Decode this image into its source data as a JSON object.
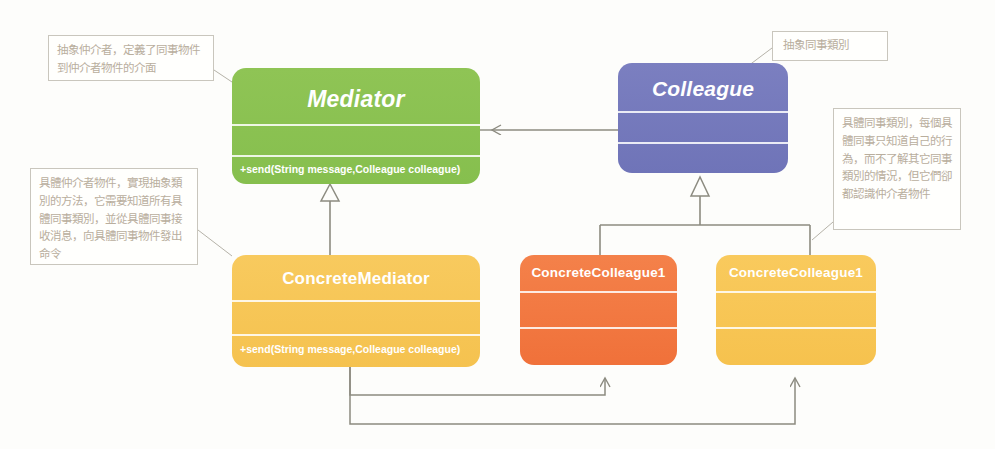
{
  "diagram": {
    "colors": {
      "mediator": "#8cc155",
      "colleague": "#7479bc",
      "concrete_mediator": "#f7c650",
      "concrete_colleague1": "#f2773f",
      "concrete_colleague2": "#f8c64f",
      "connector": "#8c8b80",
      "note_border": "#c9c6bd",
      "note_text": "#b9ae9d"
    },
    "classes": [
      {
        "id": "mediator",
        "name": "Mediator",
        "abstract": true,
        "methods": [
          "+send(String message,Colleague colleague)"
        ]
      },
      {
        "id": "colleague",
        "name": "Colleague",
        "abstract": true,
        "methods": []
      },
      {
        "id": "concrete_mediator",
        "name": "ConcreteMediator",
        "abstract": false,
        "methods": [
          "+send(String message,Colleague colleague)"
        ]
      },
      {
        "id": "concrete_colleague1",
        "name": "ConcreteColleague1",
        "abstract": false,
        "methods": []
      },
      {
        "id": "concrete_colleague2",
        "name": "ConcreteColleague1",
        "abstract": false,
        "methods": []
      }
    ],
    "notes": [
      {
        "id": "note_mediator",
        "text": "抽象仲介者，定義了同事物件到仲介者物件的介面",
        "target": "mediator"
      },
      {
        "id": "note_concrete_mediator",
        "text": "具體仲介者物件，實現抽象類別的方法，它需要知道所有具體同事類別，並從具體同事接收消息，向具體同事物件發出命令",
        "target": "concrete_mediator"
      },
      {
        "id": "note_colleague",
        "text": "抽象同事類別",
        "target": "colleague"
      },
      {
        "id": "note_concrete_colleague",
        "text": "具體同事類別，每個具體同事只知道自己的行為，而不了解其它同事類別的情況，但它們卻都認識仲介者物件",
        "target": "concrete_colleague2"
      }
    ],
    "relations": [
      {
        "from": "colleague",
        "to": "mediator",
        "type": "association",
        "arrow": "open"
      },
      {
        "from": "concrete_mediator",
        "to": "mediator",
        "type": "generalization",
        "arrow": "hollow-triangle"
      },
      {
        "from": "concrete_colleague1",
        "to": "colleague",
        "type": "generalization",
        "arrow": "hollow-triangle"
      },
      {
        "from": "concrete_colleague2",
        "to": "colleague",
        "type": "generalization",
        "arrow": "hollow-triangle"
      },
      {
        "from": "concrete_mediator",
        "to": "concrete_colleague1",
        "type": "association",
        "arrow": "open"
      },
      {
        "from": "concrete_mediator",
        "to": "concrete_colleague2",
        "type": "association",
        "arrow": "open"
      }
    ]
  }
}
